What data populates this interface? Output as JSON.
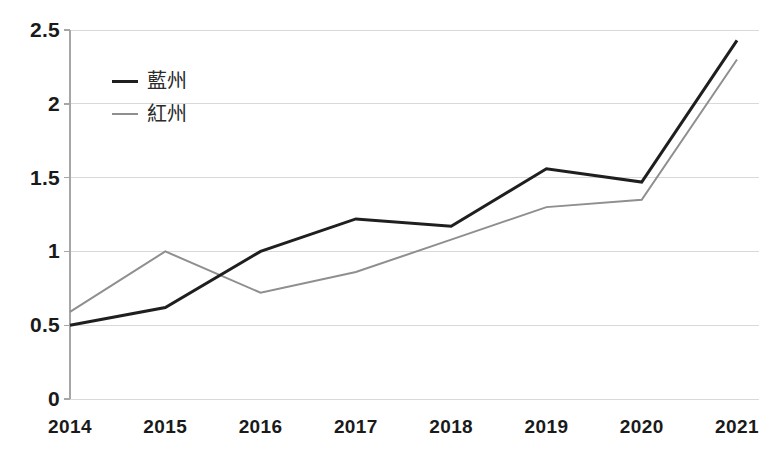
{
  "chart_data": {
    "type": "line",
    "title": "",
    "xlabel": "",
    "ylabel": "",
    "categories": [
      "2014",
      "2015",
      "2016",
      "2017",
      "2018",
      "2019",
      "2020",
      "2021"
    ],
    "x": [
      2014,
      2015,
      2016,
      2017,
      2018,
      2019,
      2020,
      2021
    ],
    "series": [
      {
        "name": "藍州",
        "color": "#1f1f1f",
        "line_width": 3,
        "values": [
          0.5,
          0.62,
          1.0,
          1.22,
          1.17,
          1.56,
          1.47,
          2.43
        ]
      },
      {
        "name": "紅州",
        "color": "#8f8f8f",
        "line_width": 2,
        "values": [
          0.59,
          1.0,
          0.72,
          0.86,
          1.08,
          1.3,
          1.35,
          2.3
        ]
      }
    ],
    "ylim": [
      0,
      2.5
    ],
    "yticks": [
      0,
      0.5,
      1,
      1.5,
      2,
      2.5
    ],
    "ytick_labels": [
      "0",
      "0.5",
      "1",
      "1.5",
      "2",
      "2.5"
    ],
    "grid": true,
    "grid_axis": "y",
    "grid_color": "#d9d9d9",
    "axis_line_color": "#a6a6a6",
    "background": "#ffffff",
    "legend_position": "upper-left-inside",
    "legend_entries": [
      "藍州",
      "紅州"
    ]
  }
}
